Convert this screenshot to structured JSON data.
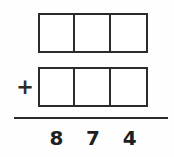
{
  "worksheet": {
    "type": "column-addition-problem",
    "background_color": "#fefefe",
    "ink_color": "#2b2b2b",
    "operator": {
      "symbol": "+",
      "name": "plus-sign"
    },
    "rule": {
      "name": "sum-line"
    },
    "addend_rows": [
      {
        "row_label": "first-addend",
        "cells": [
          {
            "value": ""
          },
          {
            "value": ""
          },
          {
            "value": ""
          }
        ]
      },
      {
        "row_label": "second-addend",
        "cells": [
          {
            "value": ""
          },
          {
            "value": ""
          },
          {
            "value": ""
          }
        ]
      }
    ],
    "sum": {
      "row_label": "sum",
      "digits": [
        {
          "place": "hundreds",
          "value": "8"
        },
        {
          "place": "tens",
          "value": "7"
        },
        {
          "place": "ones",
          "value": "4"
        }
      ]
    }
  }
}
